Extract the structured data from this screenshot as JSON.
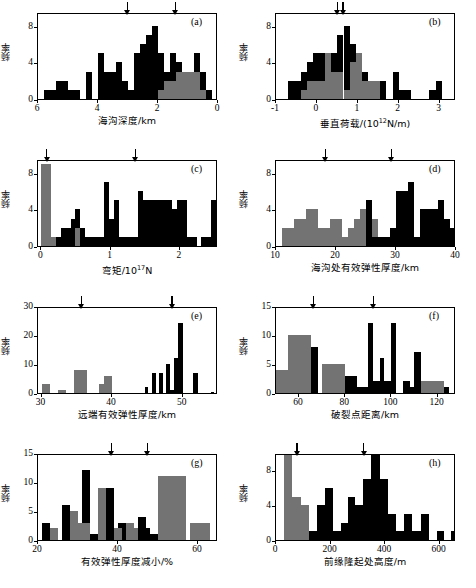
{
  "figure": {
    "ylabel": "频率",
    "colors": {
      "black": "#000000",
      "gray": "#737373",
      "axis": "#000000"
    }
  },
  "chart_data": [
    {
      "type": "bar",
      "id": "a",
      "tag": "(a)",
      "title": "",
      "xlabel": "海沟深度/km",
      "ylabel": "频率",
      "xlim": [
        6,
        0
      ],
      "ylim": [
        0,
        9.5
      ],
      "x_reversed": true,
      "xticks": [
        6,
        4,
        2,
        0
      ],
      "yticks": [
        0,
        4,
        8
      ],
      "grid": false,
      "binwidth": 0.2,
      "arrows": [
        3.0,
        1.4
      ],
      "series": [
        {
          "name": "black",
          "color": "#000000",
          "bins": [
            5.6,
            5.4,
            5.2,
            5.0,
            4.8,
            4.6,
            4.2,
            4.0,
            3.8,
            3.6,
            3.4,
            3.2,
            3.0,
            2.8,
            2.6,
            2.4,
            2.2,
            2.0,
            1.8,
            1.6,
            1.4,
            1.2,
            1.0,
            0.8,
            0.6,
            0.4,
            0.2
          ],
          "values": [
            1,
            1,
            2,
            2,
            1,
            1,
            3,
            0,
            5,
            3,
            3,
            4,
            2,
            1,
            5,
            6,
            7,
            8,
            5,
            3,
            5,
            4,
            3,
            3,
            5,
            3,
            1
          ]
        },
        {
          "name": "gray",
          "color": "#737373",
          "bins": [
            1.8,
            1.6,
            1.4,
            1.2,
            1.0,
            0.8,
            0.6,
            0.4
          ],
          "values": [
            1,
            2,
            2,
            3,
            3,
            3,
            3,
            1
          ]
        }
      ]
    },
    {
      "type": "bar",
      "id": "b",
      "tag": "(b)",
      "xlabel": "垂直荷载/(10¹²N/m)",
      "xlabel_base": "垂直荷载/(10",
      "xlabel_exp": "12",
      "xlabel_tail": "N/m)",
      "ylabel": "频率",
      "xlim": [
        -1,
        3.4
      ],
      "ylim": [
        0,
        9.5
      ],
      "xticks": [
        -1,
        0,
        1,
        2,
        3
      ],
      "yticks": [
        0,
        4,
        8
      ],
      "grid": false,
      "binwidth": 0.15,
      "arrows": [
        0.52,
        0.66
      ],
      "series": [
        {
          "name": "black",
          "color": "#000000",
          "bins": [
            -0.7,
            -0.55,
            -0.4,
            -0.25,
            -0.1,
            0.05,
            0.2,
            0.35,
            0.5,
            0.65,
            0.8,
            0.95,
            1.1,
            1.25,
            1.4,
            1.55,
            1.85,
            2.0,
            2.15,
            2.75,
            2.9
          ],
          "values": [
            2,
            2,
            3,
            4,
            5,
            5,
            5,
            5,
            7,
            8,
            6,
            5,
            3,
            2,
            2,
            2,
            3,
            1,
            1,
            1,
            2
          ]
        },
        {
          "name": "gray",
          "color": "#737373",
          "bins": [
            -0.4,
            -0.25,
            -0.1,
            0.05,
            0.2,
            0.35,
            0.5,
            0.65,
            0.8,
            0.95,
            1.1,
            1.25,
            1.4
          ],
          "values": [
            1,
            2,
            2,
            2,
            5,
            3,
            3,
            1,
            4,
            5,
            2,
            2,
            2
          ]
        }
      ]
    },
    {
      "type": "bar",
      "id": "c",
      "tag": "(c)",
      "xlabel_base": "弯矩/10",
      "xlabel_exp": "17",
      "xlabel_tail": "N",
      "xlabel": "弯矩/10¹⁷N",
      "ylabel": "频率",
      "xlim": [
        -0.05,
        2.55
      ],
      "ylim": [
        0,
        9.5
      ],
      "xticks": [
        0,
        1,
        2
      ],
      "yticks": [
        0,
        4,
        8
      ],
      "grid": false,
      "binwidth": 0.07,
      "arrows": [
        0.09,
        1.37
      ],
      "series": [
        {
          "name": "black",
          "color": "#000000",
          "bins": [
            0.07,
            0.14,
            0.21,
            0.28,
            0.35,
            0.42,
            0.49,
            0.56,
            0.63,
            0.7,
            0.77,
            0.84,
            0.91,
            0.98,
            1.05,
            1.12,
            1.19,
            1.26,
            1.33,
            1.4,
            1.47,
            1.54,
            1.61,
            1.68,
            1.75,
            1.82,
            1.89,
            1.96,
            2.03,
            2.1,
            2.17,
            2.24,
            2.31,
            2.38,
            2.45
          ],
          "values": [
            3,
            1,
            1,
            2,
            2,
            3,
            4,
            2,
            1,
            1,
            1,
            1,
            7,
            3,
            5,
            1,
            1,
            1,
            1,
            6,
            5,
            5,
            5,
            5,
            5,
            5,
            4,
            5,
            5,
            1,
            1,
            0,
            1,
            1,
            5
          ]
        },
        {
          "name": "gray",
          "color": "#737373",
          "bins": [
            0.0,
            0.07,
            0.14,
            0.49
          ],
          "values": [
            9,
            9,
            1,
            2
          ]
        }
      ]
    },
    {
      "type": "bar",
      "id": "d",
      "tag": "(d)",
      "xlabel": "海沟处有效弹性厚度/km",
      "ylabel": "频率",
      "xlim": [
        10,
        40
      ],
      "ylim": [
        0,
        9.5
      ],
      "xticks": [
        10,
        20,
        30,
        40
      ],
      "yticks": [
        0,
        4,
        8
      ],
      "grid": false,
      "binwidth": 1.0,
      "arrows": [
        18.4,
        29.4
      ],
      "series": [
        {
          "name": "gray",
          "color": "#737373",
          "bins": [
            11,
            12,
            13,
            14,
            15,
            16,
            17,
            18,
            19,
            20,
            21,
            22,
            23,
            24,
            25,
            26,
            27,
            28
          ],
          "values": [
            2,
            2,
            3,
            3,
            4,
            4,
            2,
            2,
            3,
            3,
            1,
            2,
            3,
            4,
            2,
            3,
            1,
            1
          ]
        },
        {
          "name": "black",
          "color": "#000000",
          "bins": [
            25,
            26,
            27,
            28,
            29,
            30,
            31,
            32,
            33,
            34,
            35,
            36,
            37,
            38,
            39
          ],
          "values": [
            5,
            1,
            1,
            1,
            2,
            6,
            6,
            7,
            1,
            4,
            4,
            4,
            5,
            3,
            2
          ]
        }
      ]
    },
    {
      "type": "bar",
      "id": "e",
      "tag": "(e)",
      "xlabel": "远端有效弹性厚度/km",
      "ylabel": "频率",
      "xlim": [
        29.5,
        55
      ],
      "ylim": [
        0,
        30
      ],
      "xticks": [
        30,
        40,
        50
      ],
      "yticks": [
        0,
        10,
        20,
        30
      ],
      "grid": false,
      "binwidth": 0.6,
      "arrows": [
        35.8,
        48.6
      ],
      "series": [
        {
          "name": "gray",
          "color": "#737373",
          "bins": [
            30.0,
            32.3,
            34.6,
            38.2,
            38.8
          ],
          "widths": [
            1.2,
            1.2,
            1.8,
            1.2,
            1.2
          ],
          "values": [
            3,
            1,
            8,
            3,
            6
          ]
        },
        {
          "name": "black",
          "color": "#000000",
          "bins": [
            44.6,
            45.6,
            46.6,
            47.6,
            48.2,
            48.8,
            49.4,
            51.5,
            54.0
          ],
          "widths": [
            0.5,
            0.6,
            0.6,
            0.6,
            0.6,
            0.6,
            0.6,
            0.6,
            0.5
          ],
          "values": [
            2,
            7,
            7,
            10,
            1,
            12,
            24,
            7,
            0.5
          ]
        }
      ]
    },
    {
      "type": "bar",
      "id": "f",
      "tag": "(f)",
      "xlabel": "破裂点距离/km",
      "ylabel": "频率",
      "xlim": [
        50,
        128
      ],
      "ylim": [
        0,
        15
      ],
      "xticks": [
        60,
        80,
        100,
        120
      ],
      "yticks": [
        0,
        5,
        10,
        15
      ],
      "grid": false,
      "binwidth": 5,
      "arrows": [
        66.5,
        92.5
      ],
      "series": [
        {
          "name": "gray",
          "color": "#737373",
          "bins": [
            50,
            55,
            60,
            65,
            70,
            75,
            80,
            113,
            118
          ],
          "widths": [
            5,
            5,
            5,
            5,
            5,
            5,
            5,
            5,
            5
          ],
          "values": [
            4,
            10,
            10,
            0,
            5,
            5,
            0,
            2,
            2
          ]
        },
        {
          "name": "black",
          "color": "#000000",
          "bins": [
            65,
            70,
            80,
            85,
            90,
            92,
            95,
            97,
            100,
            105,
            108,
            110,
            113,
            123
          ],
          "widths": [
            3,
            0,
            5,
            5,
            2,
            3,
            2,
            3,
            2,
            3,
            2,
            3,
            0,
            2
          ],
          "values": [
            8,
            0,
            3,
            1,
            12,
            2,
            6,
            2,
            12,
            2,
            1,
            7,
            0,
            1
          ]
        }
      ]
    },
    {
      "type": "bar",
      "id": "g",
      "tag": "(g)",
      "xlabel": "有效弹性厚度减小/%",
      "ylabel": "频率",
      "xlim": [
        20,
        65
      ],
      "ylim": [
        0,
        15
      ],
      "xticks": [
        20,
        40,
        60
      ],
      "yticks": [
        0,
        5,
        10,
        15
      ],
      "grid": false,
      "binwidth": 2,
      "arrows": [
        38.5,
        47.5
      ],
      "series": [
        {
          "name": "black",
          "color": "#000000",
          "bins": [
            21,
            26,
            31,
            33,
            37,
            40,
            45,
            46,
            48,
            55
          ],
          "widths": [
            2,
            2,
            2,
            2,
            2,
            2,
            2,
            2,
            2,
            2
          ],
          "values": [
            3,
            6,
            12,
            1,
            9,
            3,
            4,
            2,
            1,
            2
          ]
        },
        {
          "name": "gray",
          "color": "#737373",
          "bins": [
            23,
            28,
            30,
            35,
            39,
            42,
            43,
            50,
            52,
            58,
            60
          ],
          "widths": [
            2,
            2,
            3,
            2,
            2,
            2,
            2,
            2,
            5,
            2,
            3
          ],
          "values": [
            2,
            5,
            3,
            9,
            2,
            3,
            2,
            11,
            11,
            3,
            3
          ]
        }
      ]
    },
    {
      "type": "bar",
      "id": "h",
      "tag": "(h)",
      "xlabel": "前缘隆起处高度/m",
      "ylabel": "频率",
      "xlim": [
        0,
        660
      ],
      "ylim": [
        0,
        10
      ],
      "xticks": [
        0,
        200,
        400,
        600
      ],
      "yticks": [
        0,
        4,
        8
      ],
      "grid": false,
      "binwidth": 30,
      "arrows": [
        80,
        325
      ],
      "series": [
        {
          "name": "gray",
          "color": "#737373",
          "bins": [
            30,
            60,
            90,
            290
          ],
          "widths": [
            30,
            30,
            30,
            30
          ],
          "values": [
            10,
            5,
            4,
            1
          ]
        },
        {
          "name": "black",
          "color": "#000000",
          "bins": [
            120,
            150,
            180,
            210,
            240,
            265,
            290,
            320,
            350,
            380,
            410,
            440,
            470,
            500,
            530,
            590,
            640
          ],
          "widths": [
            30,
            30,
            30,
            30,
            25,
            25,
            30,
            30,
            30,
            30,
            30,
            30,
            30,
            30,
            30,
            25,
            25
          ],
          "values": [
            1,
            4,
            6,
            1,
            2,
            5,
            4,
            7,
            10,
            7,
            3,
            1,
            3,
            1,
            3,
            1,
            1
          ]
        }
      ]
    }
  ]
}
